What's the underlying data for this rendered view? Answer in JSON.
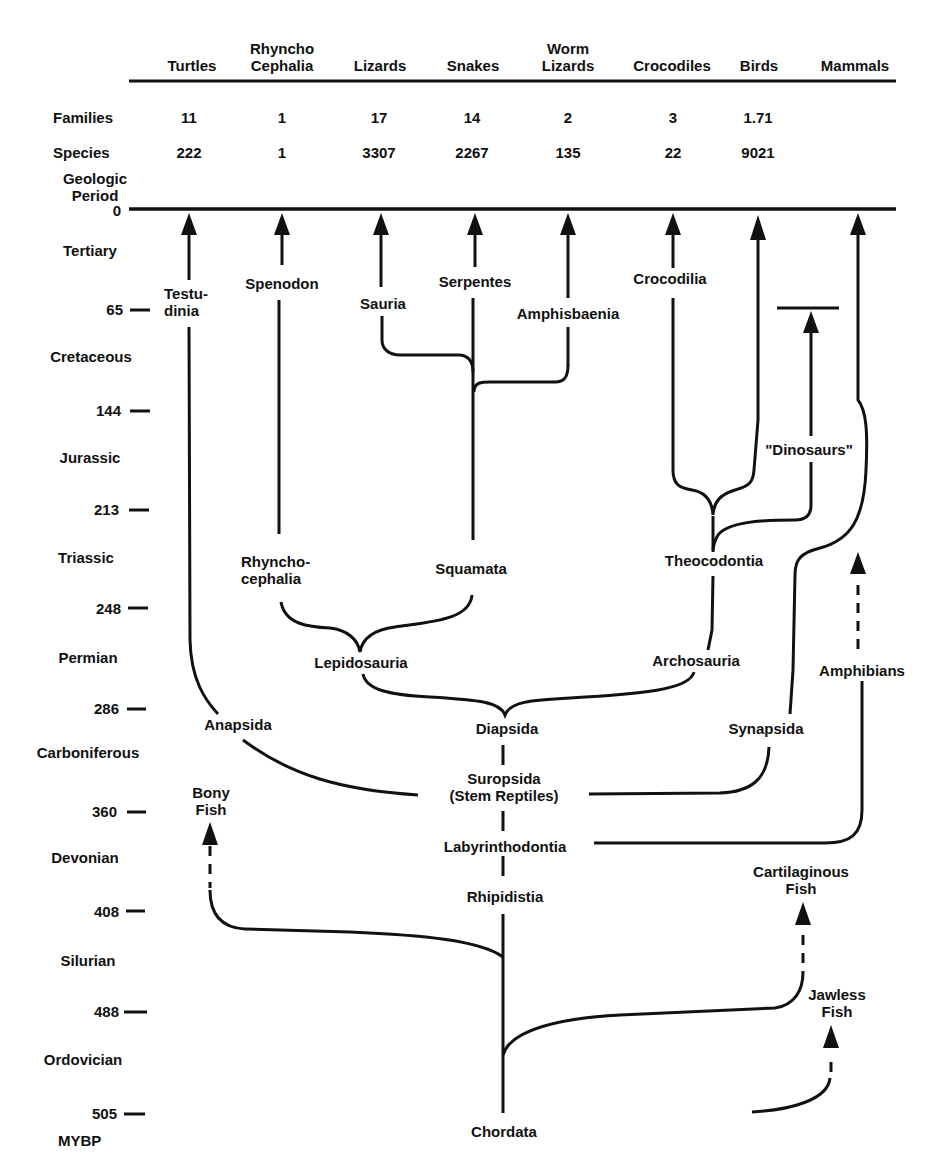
{
  "header": {
    "columns": [
      {
        "label": "Turtles",
        "x": 192
      },
      {
        "label": "Rhyncho\nCephalia",
        "x": 282
      },
      {
        "label": "Lizards",
        "x": 380
      },
      {
        "label": "Snakes",
        "x": 473
      },
      {
        "label": "Worm\nLizards",
        "x": 568
      },
      {
        "label": "Crocodiles",
        "x": 672
      },
      {
        "label": "Birds",
        "x": 759
      },
      {
        "label": "Mammals",
        "x": 855
      }
    ]
  },
  "rows": {
    "families_label": "Families",
    "species_label": "Species",
    "families": [
      "11",
      "1",
      "17",
      "14",
      "2",
      "3",
      "1.71",
      ""
    ],
    "species": [
      "222",
      "1",
      "3307",
      "2267",
      "135",
      "22",
      "9021",
      ""
    ]
  },
  "time_axis": {
    "title": "Geologic\nPeriod",
    "unit_label": "MYBP",
    "ticks": [
      {
        "value": "0",
        "y": 210
      },
      {
        "value": "65",
        "y": 310
      },
      {
        "value": "144",
        "y": 410
      },
      {
        "value": "213",
        "y": 510
      },
      {
        "value": "248",
        "y": 608
      },
      {
        "value": "286",
        "y": 709
      },
      {
        "value": "360",
        "y": 811
      },
      {
        "value": "408",
        "y": 911
      },
      {
        "value": "488",
        "y": 1012
      },
      {
        "value": "505",
        "y": 1112
      }
    ],
    "periods": [
      {
        "name": "Tertiary",
        "y": 250
      },
      {
        "name": "Cretaceous",
        "y": 357
      },
      {
        "name": "Jurassic",
        "y": 458
      },
      {
        "name": "Triassic",
        "y": 558
      },
      {
        "name": "Permian",
        "y": 658
      },
      {
        "name": "Carboniferous",
        "y": 753
      },
      {
        "name": "Devonian",
        "y": 858
      },
      {
        "name": "Silurian",
        "y": 961
      },
      {
        "name": "Ordovician",
        "y": 1060
      }
    ]
  },
  "taxa": {
    "testudinia": "Testu-\ndinia",
    "spenodon": "Spenodon",
    "sauria": "Sauria",
    "serpentes": "Serpentes",
    "amphisbaenia": "Amphisbaenia",
    "crocodilia": "Crocodilia",
    "dinosaurs": "\"Dinosaurs\"",
    "rhynchocephalia": "Rhyncho-\ncephalia",
    "squamata": "Squamata",
    "theocodontia": "Theocodontia",
    "lepidosauria": "Lepidosauria",
    "archosauria": "Archosauria",
    "amphibians": "Amphibians",
    "anapsida": "Anapsida",
    "diapsida": "Diapsida",
    "synapsida": "Synapsida",
    "suropsida": "Suropsida\n(Stem Reptiles)",
    "bony_fish": "Bony\nFish",
    "labyrinthodontia": "Labyrinthodontia",
    "rhipidistia": "Rhipidistia",
    "cartilaginous_fish": "Cartilaginous\nFish",
    "jawless_fish": "Jawless\nFish",
    "chordata": "Chordata"
  }
}
